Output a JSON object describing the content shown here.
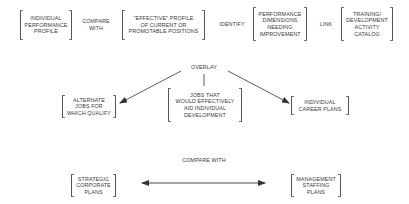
{
  "top_row": {
    "box1": "INDIVIDUAL\nPERFORMANCE\nPROFILE",
    "connector1": "COMPARE\nWITH",
    "box2": "\"EFFECTIVE\" PROFILE\nOF CURRENT OR\nPROMOTABLE POSITIONS",
    "connector2": "IDENTIFY",
    "box3": "PERFORMANCE\nDIMENSIONS\nNEEDING\nIMPROVEMENT",
    "connector3": "LINK",
    "box4": "TRAINING/\nDEVELOPMENT\nACTIVITY\nCATALOG"
  },
  "overlay": {
    "label": "OVERLAY",
    "left_box": "ALTERNATE\nJOBS FOR\nWHICH QUALIFY",
    "center_box": "JOBS THAT\nWOULD EFFECTIVELY\nAID INDIVIDUAL\nDEVELOPMENT",
    "right_box": "INDIVIDUAL\nCAREER PLANS"
  },
  "bottom": {
    "label": "COMPARE WITH",
    "left_box": "STRATEGIC\nCORPORATE\nPLANS",
    "right_box": "MANAGEMENT\nSTAFFING\nPLANS"
  },
  "colors": {
    "line": "#333333",
    "text": "#3a3a3a",
    "background": "#ffffff"
  }
}
